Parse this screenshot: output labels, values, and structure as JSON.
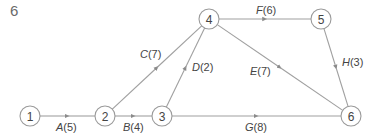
{
  "figure": {
    "number": "6"
  },
  "colors": {
    "line": "#a0a0a0",
    "node_stroke": "#9a9a9a",
    "text": "#444444",
    "arrow": "#8a8a8a"
  },
  "nodes": [
    {
      "id": "1",
      "label": "1",
      "x": 30,
      "y": 116
    },
    {
      "id": "2",
      "label": "2",
      "x": 105,
      "y": 116
    },
    {
      "id": "3",
      "label": "3",
      "x": 162,
      "y": 116
    },
    {
      "id": "4",
      "label": "4",
      "x": 209,
      "y": 19
    },
    {
      "id": "5",
      "label": "5",
      "x": 321,
      "y": 19
    },
    {
      "id": "6",
      "label": "6",
      "x": 351,
      "y": 116
    }
  ],
  "edges": [
    {
      "from": "1",
      "to": "2",
      "activity": "A",
      "duration": "5",
      "label": "A(5)",
      "lx": 56,
      "ly": 131
    },
    {
      "from": "2",
      "to": "3",
      "activity": "B",
      "duration": "4",
      "label": "B(4)",
      "lx": 123,
      "ly": 131
    },
    {
      "from": "2",
      "to": "4",
      "activity": "C",
      "duration": "7",
      "label": "C(7)",
      "lx": 140,
      "ly": 58
    },
    {
      "from": "3",
      "to": "4",
      "activity": "D",
      "duration": "2",
      "label": "D(2)",
      "lx": 192,
      "ly": 71
    },
    {
      "from": "4",
      "to": "6",
      "activity": "E",
      "duration": "7",
      "label": "E(7)",
      "lx": 250,
      "ly": 75
    },
    {
      "from": "4",
      "to": "5",
      "activity": "F",
      "duration": "6",
      "label": "F(6)",
      "lx": 256,
      "ly": 14
    },
    {
      "from": "3",
      "to": "6",
      "activity": "G",
      "duration": "8",
      "label": "G(8)",
      "lx": 245,
      "ly": 131
    },
    {
      "from": "5",
      "to": "6",
      "activity": "H",
      "duration": "3",
      "label": "H(3)",
      "lx": 342,
      "ly": 66
    }
  ]
}
